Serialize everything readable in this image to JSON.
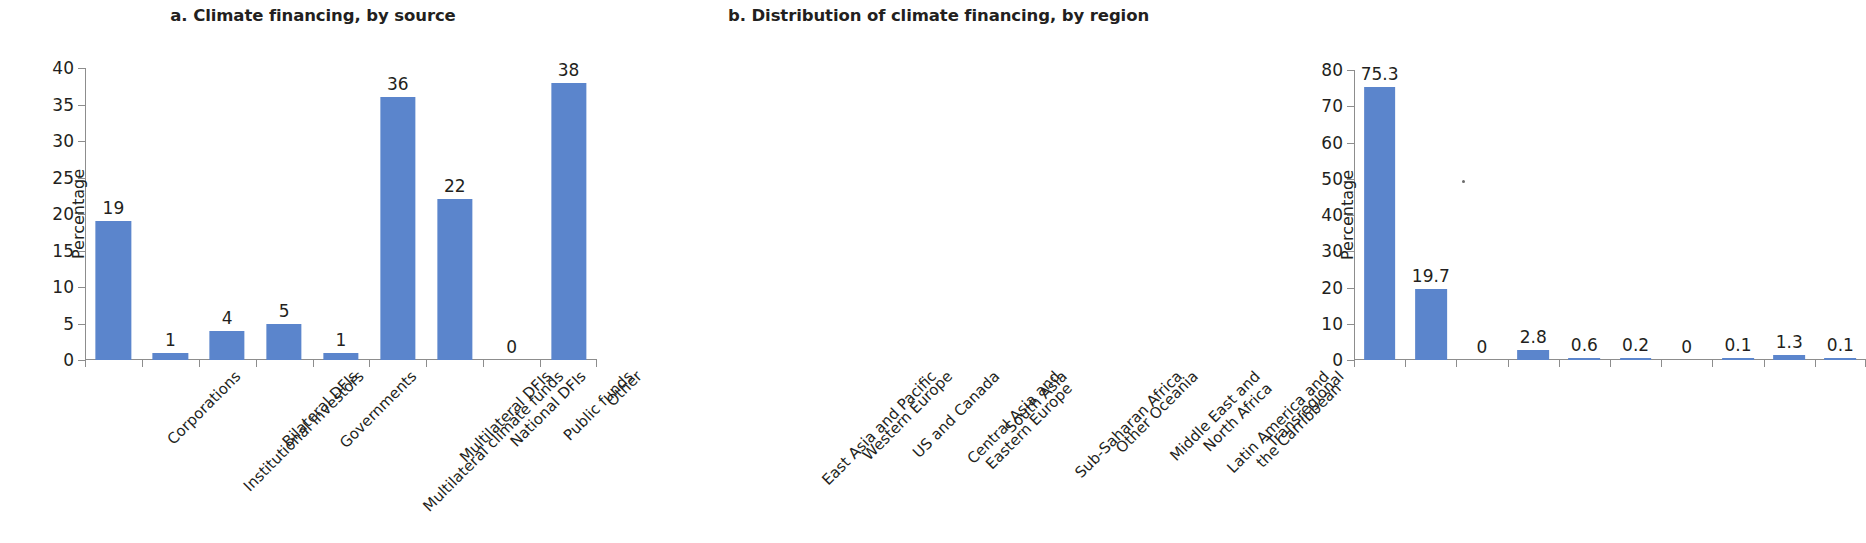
{
  "chart_data": [
    {
      "type": "bar",
      "panel": "a",
      "title": "a. Climate financing, by source",
      "xlabel": "",
      "ylabel": "Percentage",
      "ylim": [
        0,
        40
      ],
      "ytick_values": [
        0,
        5,
        10,
        15,
        20,
        25,
        30,
        35,
        40
      ],
      "ytick_labels": [
        "0",
        "5",
        "10",
        "15",
        "20",
        "25",
        "30",
        "35",
        "40"
      ],
      "grid": false,
      "legend": null,
      "bar_color": "#5b85cc",
      "categories": [
        "Corporations",
        "Institutional investors",
        "Bilateral DFIs",
        "Governments",
        "Multilateral climate funds",
        "Multilateral DFIs",
        "National DFIs",
        "Public funds",
        "Other"
      ],
      "values": [
        19,
        1,
        4,
        5,
        1,
        36,
        22,
        0,
        38
      ],
      "data_labels": [
        "19",
        "1",
        "4",
        "5",
        "1",
        "36",
        "22",
        "0",
        "38"
      ]
    },
    {
      "type": "bar",
      "panel": "b",
      "title": "b. Distribution of climate financing, by region",
      "xlabel": "",
      "ylabel": "Percentage",
      "ylim": [
        0,
        80
      ],
      "ytick_values": [
        0,
        10,
        20,
        30,
        40,
        50,
        60,
        70,
        80
      ],
      "ytick_labels": [
        "0",
        "10",
        "20",
        "30",
        "40",
        "50",
        "60",
        "70",
        "80"
      ],
      "grid": false,
      "legend": null,
      "bar_color": "#5b85cc",
      "categories": [
        "East Asia and Pacific",
        "Western Europe",
        "US and Canada",
        "Central Asia and\nEastern Europe",
        "South Asia",
        "Sub-Saharan Africa",
        "Other Oceania",
        "Middle East and\nNorth Africa",
        "Latin America and\nthe Carribbean",
        "Transregional"
      ],
      "values": [
        75.3,
        19.7,
        0,
        2.8,
        0.6,
        0.2,
        0,
        0.1,
        1.3,
        0.1
      ],
      "data_labels": [
        "75.3",
        "19.7",
        "0",
        "2.8",
        "0.6",
        "0.2",
        "0",
        "0.1",
        "1.3",
        "0.1"
      ]
    }
  ],
  "colors": {
    "bar": "#5b85cc",
    "text": "#231f20",
    "axis": "#8d8d8d",
    "background": "#ffffff"
  }
}
